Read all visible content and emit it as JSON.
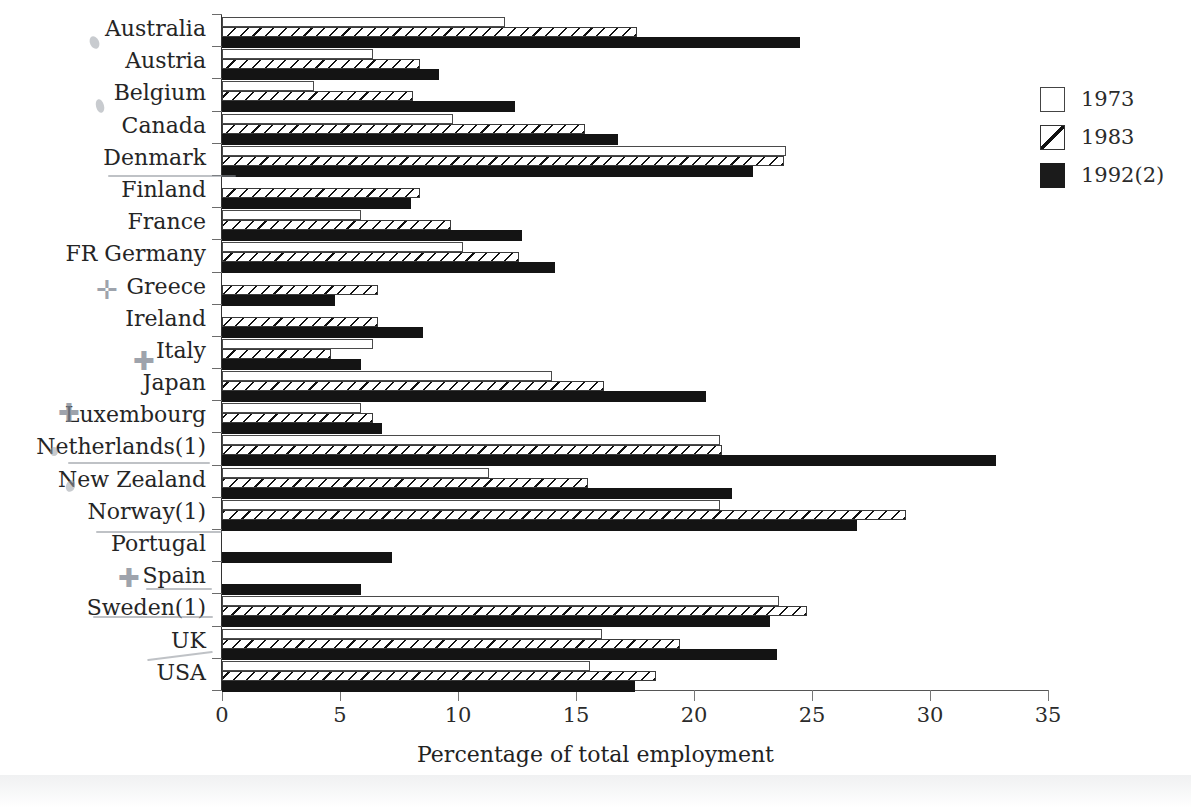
{
  "chart_data": {
    "type": "bar",
    "orientation": "horizontal",
    "title": "",
    "xlabel": "Percentage of  total employment",
    "ylabel": "",
    "xlim": [
      0,
      35
    ],
    "xticks": [
      0,
      5,
      10,
      15,
      20,
      25,
      30,
      35
    ],
    "grid": false,
    "legend_position": "right",
    "categories": [
      "Australia",
      "Austria",
      "Belgium",
      "Canada",
      "Denmark",
      "Finland",
      "France",
      "FR Germany",
      "Greece",
      "Ireland",
      "Italy",
      "Japan",
      "Luxembourg",
      "Netherlands(1)",
      "New Zealand",
      "Norway(1)",
      "Portugal",
      "Spain",
      "Sweden(1)",
      "UK",
      "USA"
    ],
    "series": [
      {
        "name": "1973",
        "style": "open",
        "values": [
          12.0,
          6.4,
          3.9,
          9.8,
          23.9,
          null,
          5.9,
          10.2,
          null,
          null,
          6.4,
          14.0,
          5.9,
          21.1,
          11.3,
          21.1,
          null,
          null,
          23.6,
          16.1,
          15.6
        ]
      },
      {
        "name": "1983",
        "style": "hatched",
        "values": [
          17.6,
          8.4,
          8.1,
          15.4,
          23.8,
          8.4,
          9.7,
          12.6,
          6.6,
          6.6,
          4.6,
          16.2,
          6.4,
          21.2,
          15.5,
          29.0,
          null,
          null,
          24.8,
          19.4,
          18.4
        ]
      },
      {
        "name": "1992(2)",
        "style": "solid",
        "values": [
          24.5,
          9.2,
          12.4,
          16.8,
          22.5,
          8.0,
          12.7,
          14.1,
          4.8,
          8.5,
          5.9,
          20.5,
          6.8,
          32.8,
          21.6,
          26.9,
          7.2,
          5.9,
          23.2,
          23.5,
          17.5
        ]
      }
    ]
  },
  "legend": {
    "items": [
      {
        "label": "1973",
        "swatch": "open-square"
      },
      {
        "label": "1983",
        "swatch": "hatched-square"
      },
      {
        "label": "1992(2)",
        "swatch": "filled-square"
      }
    ]
  },
  "axis": {
    "title": "Percentage of  total employment",
    "tick_labels": [
      "0",
      "5",
      "10",
      "15",
      "20",
      "25",
      "30",
      "35"
    ]
  },
  "colors": {
    "series_1973_fill": "#ffffff",
    "series_1973_stroke": "#4a4a4a",
    "series_1983_hatch": "#111111",
    "series_1992_fill": "#141414",
    "axis": "#555555",
    "text": "#252525",
    "annotation_pen": "#8a8f98"
  }
}
